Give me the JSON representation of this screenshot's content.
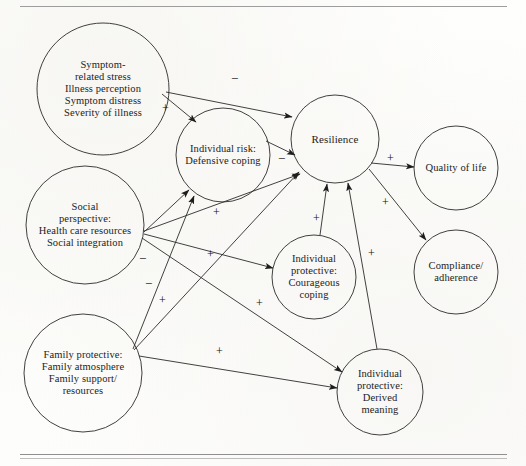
{
  "figure": {
    "type": "conceptual-path-diagram",
    "background_color": "#fdfdfc",
    "line_color": "#2b2b2b",
    "text_color": "#1c1c1c",
    "rules": {
      "top": true,
      "bottom": true
    }
  },
  "nodes": [
    {
      "id": "symptom-related-stress",
      "label": "Symptom-\nrelated stress\nIllness perception\nSymptom distress\nSeverity of illness",
      "cx": 103,
      "cy": 89,
      "r": 66,
      "font_size": 10.5
    },
    {
      "id": "individual-risk-defensive-coping",
      "label": "Individual risk:\nDefensive coping",
      "cx": 223,
      "cy": 155,
      "r": 47,
      "font_size": 10.5
    },
    {
      "id": "resilience",
      "label": "Resilience",
      "cx": 335,
      "cy": 139,
      "r": 44,
      "font_size": 11
    },
    {
      "id": "quality-of-life",
      "label": "Quality of life",
      "cx": 456,
      "cy": 168,
      "r": 42,
      "font_size": 10.5
    },
    {
      "id": "compliance-adherence",
      "label": "Compliance/\nadherence",
      "cx": 456,
      "cy": 272,
      "r": 42,
      "font_size": 10.5
    },
    {
      "id": "social-perspective",
      "label": "Social\nperspective:\nHealth care resources\nSocial integration",
      "cx": 85,
      "cy": 225,
      "r": 59,
      "font_size": 10.5
    },
    {
      "id": "individual-protective-courageous-coping",
      "label": "Individual\nprotective:\nCourageous\ncoping",
      "cx": 314,
      "cy": 277,
      "r": 42,
      "font_size": 10.5
    },
    {
      "id": "family-protective",
      "label": "Family protective:\nFamily atmosphere\nFamily support/\nresources",
      "cx": 83,
      "cy": 373,
      "r": 59,
      "font_size": 10.5
    },
    {
      "id": "individual-protective-derived-meaning",
      "label": "Individual\nprotective:\nDerived\nmeaning",
      "cx": 380,
      "cy": 392,
      "r": 43,
      "font_size": 10.5
    }
  ],
  "edges": [
    {
      "id": "symptom-to-resilience",
      "from": "symptom-related-stress",
      "to": "resilience",
      "sign": "−",
      "sign_x": 231,
      "sign_y": 72,
      "x1": 166,
      "y1": 92,
      "x2": 292,
      "y2": 117
    },
    {
      "id": "symptom-to-individual-risk",
      "from": "symptom-related-stress",
      "to": "individual-risk-defensive-coping",
      "sign": "+",
      "sign_x": 162,
      "sign_y": 102,
      "x1": 162,
      "y1": 94,
      "x2": 196,
      "y2": 122
    },
    {
      "id": "individual-risk-to-resilience",
      "from": "individual-risk-defensive-coping",
      "to": "resilience",
      "sign": "−",
      "sign_x": 278,
      "sign_y": 152,
      "x1": 266,
      "y1": 141,
      "x2": 295,
      "y2": 155
    },
    {
      "id": "resilience-to-quality-of-life",
      "from": "resilience",
      "to": "quality-of-life",
      "sign": "+",
      "sign_x": 387,
      "sign_y": 152,
      "x1": 371,
      "y1": 163,
      "x2": 414,
      "y2": 167
    },
    {
      "id": "resilience-to-compliance",
      "from": "resilience",
      "to": "compliance-adherence",
      "sign": "+",
      "sign_x": 382,
      "sign_y": 196,
      "x1": 369,
      "y1": 169,
      "x2": 426,
      "y2": 240
    },
    {
      "id": "social-to-individual-risk",
      "from": "social-perspective",
      "to": "individual-risk-defensive-coping",
      "sign": "−",
      "sign_x": 139,
      "sign_y": 252,
      "x1": 144,
      "y1": 232,
      "x2": 189,
      "y2": 190
    },
    {
      "id": "social-to-resilience",
      "from": "social-perspective",
      "to": "resilience",
      "sign": "+",
      "sign_x": 213,
      "sign_y": 206,
      "x1": 144,
      "y1": 231,
      "x2": 300,
      "y2": 174
    },
    {
      "id": "social-to-courageous-coping",
      "from": "social-perspective",
      "to": "individual-protective-courageous-coping",
      "sign": "+",
      "sign_x": 207,
      "sign_y": 248,
      "x1": 144,
      "y1": 234,
      "x2": 273,
      "y2": 268
    },
    {
      "id": "family-to-individual-risk",
      "from": "family-protective",
      "to": "individual-risk-defensive-coping",
      "sign": "−",
      "sign_x": 145,
      "sign_y": 277,
      "x1": 133,
      "y1": 349,
      "x2": 194,
      "y2": 196
    },
    {
      "id": "family-to-resilience",
      "from": "family-protective",
      "to": "resilience",
      "sign": "+",
      "sign_x": 159,
      "sign_y": 294,
      "x1": 134,
      "y1": 350,
      "x2": 299,
      "y2": 172
    },
    {
      "id": "family-to-derived-meaning",
      "from": "family-protective",
      "to": "individual-protective-derived-meaning",
      "sign": "+",
      "sign_x": 216,
      "sign_y": 345,
      "x1": 139,
      "y1": 356,
      "x2": 337,
      "y2": 388
    },
    {
      "id": "courageous-coping-to-resilience",
      "from": "individual-protective-courageous-coping",
      "to": "resilience",
      "sign": "+",
      "sign_x": 313,
      "sign_y": 212,
      "x1": 320,
      "y1": 235,
      "x2": 327,
      "y2": 184
    },
    {
      "id": "derived-meaning-to-resilience",
      "from": "individual-protective-derived-meaning",
      "to": "resilience",
      "sign": "+",
      "sign_x": 368,
      "sign_y": 247,
      "x1": 377,
      "y1": 349,
      "x2": 348,
      "y2": 183
    },
    {
      "id": "social-to-derived-meaning",
      "from": "social-perspective",
      "to": "individual-protective-derived-meaning",
      "sign": "+",
      "sign_x": 256,
      "sign_y": 297,
      "x1": 142,
      "y1": 238,
      "x2": 342,
      "y2": 372
    }
  ]
}
